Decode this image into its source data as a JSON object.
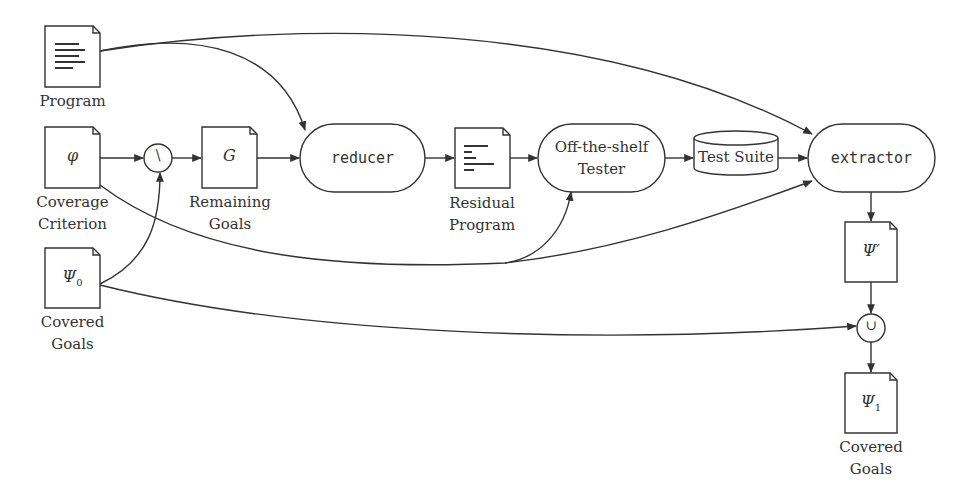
{
  "diagram": {
    "type": "flow",
    "nodes": {
      "program": {
        "label": "Program",
        "icon": "document-text-icon"
      },
      "coverage_criterion": {
        "symbol": "φ",
        "label": "Coverage\nCriterion"
      },
      "covered_goals_in": {
        "symbol": "Ψ",
        "subscript": "0",
        "label": "Covered\nGoals"
      },
      "setminus": {
        "symbol": "\\"
      },
      "remaining_goals": {
        "symbol": "G",
        "label": "Remaining\nGoals"
      },
      "reducer": {
        "label": "reducer"
      },
      "residual_program": {
        "label": "Residual\nProgram",
        "icon": "document-text-icon"
      },
      "tester": {
        "label": "Off-the-shelf\nTester"
      },
      "test_suite": {
        "label": "Test Suite"
      },
      "extractor": {
        "label": "extractor"
      },
      "psi_prime": {
        "symbol": "Ψ′"
      },
      "union": {
        "symbol": "∪"
      },
      "covered_goals_out": {
        "symbol": "Ψ",
        "subscript": "1",
        "label": "Covered\nGoals"
      }
    },
    "edges": [
      {
        "from": "program",
        "to": "reducer"
      },
      {
        "from": "program",
        "to": "extractor"
      },
      {
        "from": "coverage_criterion",
        "to": "setminus"
      },
      {
        "from": "coverage_criterion",
        "to": "tester"
      },
      {
        "from": "coverage_criterion",
        "to": "extractor"
      },
      {
        "from": "covered_goals_in",
        "to": "setminus"
      },
      {
        "from": "covered_goals_in",
        "to": "union"
      },
      {
        "from": "setminus",
        "to": "remaining_goals"
      },
      {
        "from": "remaining_goals",
        "to": "reducer"
      },
      {
        "from": "reducer",
        "to": "residual_program"
      },
      {
        "from": "residual_program",
        "to": "tester"
      },
      {
        "from": "tester",
        "to": "test_suite"
      },
      {
        "from": "test_suite",
        "to": "extractor"
      },
      {
        "from": "extractor",
        "to": "psi_prime"
      },
      {
        "from": "psi_prime",
        "to": "union"
      },
      {
        "from": "union",
        "to": "covered_goals_out"
      }
    ],
    "colors": {
      "stroke": "#333333",
      "background": "#ffffff"
    }
  }
}
